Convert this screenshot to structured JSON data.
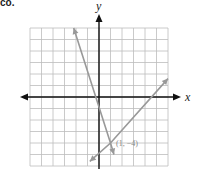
{
  "problem": {
    "label": "co."
  },
  "chart_data": {
    "type": "line",
    "title": "",
    "xlabel": "x",
    "ylabel": "y",
    "xlim": [
      -6,
      6
    ],
    "ylim": [
      -6,
      6
    ],
    "grid": true,
    "series": [
      {
        "name": "line-1",
        "points": [
          [
            -2.2,
            6
          ],
          [
            1,
            -4
          ],
          [
            1.3,
            -5
          ]
        ],
        "color": "#999999"
      },
      {
        "name": "line-2",
        "points": [
          [
            -0.8,
            -5.6
          ],
          [
            1,
            -4
          ],
          [
            6,
            1.6
          ]
        ],
        "color": "#999999"
      }
    ],
    "annotations": [
      {
        "text": "(1, −4)",
        "x": 1,
        "y": -4
      }
    ]
  },
  "axes": {
    "x_label": "x",
    "y_label": "y"
  },
  "annotation": {
    "point_label": "(1, −4)"
  }
}
